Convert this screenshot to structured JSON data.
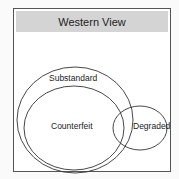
{
  "diagram": {
    "title": "Western View",
    "sets": [
      {
        "label": "Substandard"
      },
      {
        "label": "Counterfeit"
      },
      {
        "label": "Degraded"
      }
    ]
  }
}
